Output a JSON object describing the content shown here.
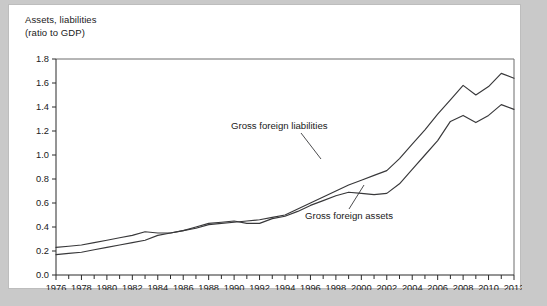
{
  "figure": {
    "background_color": "#c9c9c9",
    "card_color": "#ffffff",
    "line_color": "#38383a"
  },
  "title": {
    "line1": "Assets, liabilities",
    "line2": "(ratio to GDP)"
  },
  "annotations": {
    "liabilities": "Gross foreign liabilities",
    "assets": "Gross foreign assets"
  },
  "chart_data": {
    "type": "line",
    "title": "Assets, liabilities (ratio to GDP)",
    "xlabel": "",
    "ylabel": "Assets, liabilities (ratio to GDP)",
    "xlim": [
      1976,
      2012
    ],
    "ylim": [
      0.0,
      1.8
    ],
    "ytick_labels": [
      "0.0",
      "0.2",
      "0.4",
      "0.6",
      "0.8",
      "1.0",
      "1.2",
      "1.4",
      "1.6",
      "1.8"
    ],
    "ytick_values": [
      0.0,
      0.2,
      0.4,
      0.6,
      0.8,
      1.0,
      1.2,
      1.4,
      1.6,
      1.8
    ],
    "xtick_labels": [
      "1976",
      "1978",
      "1980",
      "1982",
      "1984",
      "1986",
      "1988",
      "1990",
      "1992",
      "1994",
      "1996",
      "1998",
      "2000",
      "2002",
      "2004",
      "2006",
      "2008",
      "2010",
      "2012"
    ],
    "xtick_values": [
      1976,
      1978,
      1980,
      1982,
      1984,
      1986,
      1988,
      1990,
      1992,
      1994,
      1996,
      1998,
      2000,
      2002,
      2004,
      2006,
      2008,
      2010,
      2012
    ],
    "minor_xticks_every": 1,
    "grid": false,
    "legend": "annotated-inline",
    "x": [
      1976,
      1977,
      1978,
      1979,
      1980,
      1981,
      1982,
      1983,
      1984,
      1985,
      1986,
      1987,
      1988,
      1989,
      1990,
      1991,
      1992,
      1993,
      1994,
      1995,
      1996,
      1997,
      1998,
      1999,
      2000,
      2001,
      2002,
      2003,
      2004,
      2005,
      2006,
      2007,
      2008,
      2009,
      2010,
      2011,
      2012
    ],
    "series": [
      {
        "name": "Gross foreign liabilities",
        "values": [
          0.23,
          0.24,
          0.25,
          0.27,
          0.29,
          0.31,
          0.33,
          0.36,
          0.35,
          0.35,
          0.37,
          0.39,
          0.42,
          0.43,
          0.44,
          0.45,
          0.46,
          0.48,
          0.5,
          0.55,
          0.6,
          0.65,
          0.7,
          0.75,
          0.79,
          0.83,
          0.87,
          0.97,
          1.09,
          1.21,
          1.34,
          1.46,
          1.58,
          1.5,
          1.57,
          1.68,
          1.64
        ]
      },
      {
        "name": "Gross foreign assets",
        "values": [
          0.17,
          0.18,
          0.19,
          0.21,
          0.23,
          0.25,
          0.27,
          0.29,
          0.33,
          0.35,
          0.37,
          0.4,
          0.43,
          0.44,
          0.45,
          0.43,
          0.43,
          0.47,
          0.49,
          0.53,
          0.58,
          0.62,
          0.66,
          0.69,
          0.68,
          0.67,
          0.68,
          0.76,
          0.88,
          1.0,
          1.12,
          1.28,
          1.33,
          1.27,
          1.33,
          1.42,
          1.38
        ]
      }
    ]
  }
}
